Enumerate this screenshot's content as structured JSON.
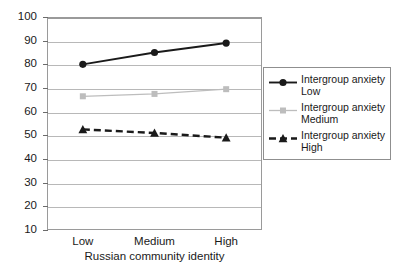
{
  "chart_data": {
    "type": "line",
    "title": "",
    "xlabel": "Russian community identity",
    "ylabel": "",
    "categories": [
      "Low",
      "Medium",
      "High"
    ],
    "ylim": [
      10,
      100
    ],
    "yticks": [
      100,
      90,
      80,
      70,
      60,
      50,
      40,
      30,
      20,
      10
    ],
    "grid": true,
    "legend_position": "right",
    "series": [
      {
        "name": "Intergroup anxiety Low",
        "name_line1": "Intergroup anxiety",
        "name_line2": "Low",
        "values": [
          80,
          85,
          89
        ],
        "color": "#1a1a1a",
        "marker": "circle",
        "dash": "solid"
      },
      {
        "name": "Intergroup anxiety Medium",
        "name_line1": "Intergroup anxiety",
        "name_line2": "Medium",
        "values": [
          66.5,
          67.5,
          69.5
        ],
        "color": "#bdbdbd",
        "marker": "square",
        "dash": "solid"
      },
      {
        "name": "Intergroup anxiety High",
        "name_line1": "Intergroup anxiety",
        "name_line2": "High",
        "values": [
          52.5,
          51,
          49
        ],
        "color": "#1a1a1a",
        "marker": "triangle",
        "dash": "dashed"
      }
    ]
  },
  "axis": {
    "y_labels": [
      "100",
      "90",
      "80",
      "70",
      "60",
      "50",
      "40",
      "30",
      "20",
      "10"
    ],
    "x_labels": [
      "Low",
      "Medium",
      "High"
    ],
    "x_title": "Russian community identity"
  },
  "legend": {
    "entries": [
      {
        "line1": "Intergroup anxiety",
        "line2": "Low"
      },
      {
        "line1": "Intergroup anxiety",
        "line2": "Medium"
      },
      {
        "line1": "Intergroup anxiety",
        "line2": "High"
      }
    ]
  }
}
